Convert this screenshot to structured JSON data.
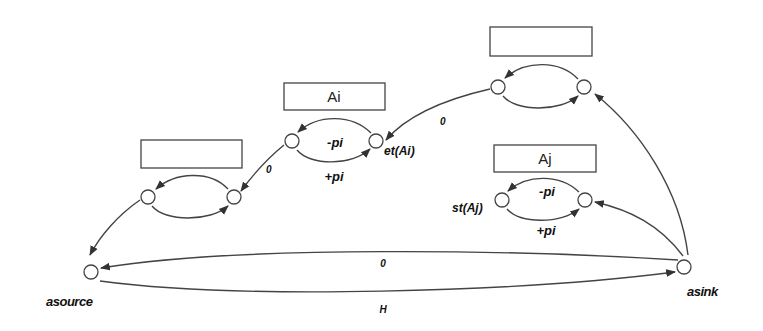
{
  "diagram": {
    "type": "activity-network",
    "colors": {
      "stroke": "#444444",
      "background": "#ffffff",
      "text": "#111111"
    },
    "activities": [
      {
        "id": "left",
        "label": "",
        "box": [
          141,
          140,
          101,
          28
        ],
        "start_node": [
          148,
          197
        ],
        "end_node": [
          234,
          197
        ],
        "minus_label": "",
        "plus_label": ""
      },
      {
        "id": "Ai",
        "label": "Ai",
        "box": [
          284,
          83,
          101,
          27
        ],
        "start_node": [
          292,
          141
        ],
        "end_node": [
          376,
          141
        ],
        "minus_label": "-pi",
        "plus_label": "+pi",
        "end_node_label": "et(Ai)"
      },
      {
        "id": "topright",
        "label": "",
        "box": [
          490,
          27,
          102,
          29
        ],
        "start_node": [
          498,
          87
        ],
        "end_node": [
          584,
          87
        ],
        "minus_label": "",
        "plus_label": ""
      },
      {
        "id": "Aj",
        "label": "Aj",
        "box": [
          494,
          145,
          102,
          27
        ],
        "start_node": [
          502,
          200
        ],
        "end_node": [
          585,
          200
        ],
        "minus_label": "-pi",
        "plus_label": "+pi",
        "start_node_label": "st(Aj)"
      }
    ],
    "source": {
      "label": "asource",
      "pos": [
        91,
        272
      ]
    },
    "sink": {
      "label": "asink",
      "pos": [
        684,
        267
      ]
    },
    "edges": [
      {
        "from": "topright.start",
        "to": "Ai.end",
        "label": "0"
      },
      {
        "from": "Ai.start",
        "to": "left.end",
        "label": "0"
      },
      {
        "from": "left.start",
        "to": "source",
        "label": ""
      },
      {
        "from": "sink",
        "to": "source",
        "label": "0"
      },
      {
        "from": "source",
        "to": "sink",
        "label": "H"
      },
      {
        "from": "sink",
        "to": "topright.end",
        "label": ""
      },
      {
        "from": "sink",
        "to": "Aj.end",
        "label": ""
      }
    ]
  },
  "labels": {
    "ai_box": "Ai",
    "aj_box": "Aj",
    "ai_minus": "-pi",
    "ai_plus": "+pi",
    "aj_minus": "-pi",
    "aj_plus": "+pi",
    "et_ai": "et(Ai)",
    "st_aj": "st(Aj)",
    "edge_top_to_ai": "0",
    "edge_ai_to_left": "0",
    "edge_sink_to_source": "0",
    "edge_source_to_sink": "H",
    "source": "asource",
    "sink": "asink"
  }
}
